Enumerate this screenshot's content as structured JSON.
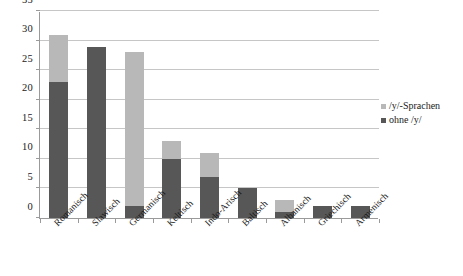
{
  "chart_data": {
    "type": "bar",
    "title": "",
    "subtitle": "",
    "xlabel": "",
    "ylabel": "",
    "ylim": [
      0,
      35
    ],
    "ytick_step": 5,
    "ytick_labels": [
      "0",
      "5",
      "10",
      "15",
      "20",
      "25",
      "30",
      "35"
    ],
    "grid": true,
    "stacked": true,
    "legend_position": "right-middle-outside",
    "categories": [
      "Romanisch",
      "Slawisch",
      "Germanisch",
      "Keltisch",
      "Indo-Arisch",
      "Baltisch",
      "Albanisch",
      "Griechisch",
      "Armenisch"
    ],
    "series": [
      {
        "name": "ohne /y/",
        "color": "#575757",
        "values": [
          23,
          29,
          2,
          10,
          7,
          5,
          1,
          2,
          2
        ]
      },
      {
        "name": "/y/-Sprachen",
        "color": "#b8b8b8",
        "values": [
          8,
          0,
          26,
          3,
          4,
          0,
          2,
          0,
          0
        ]
      }
    ],
    "totals": [
      31,
      29,
      28,
      13,
      11,
      5,
      3,
      2,
      2
    ]
  },
  "legend": {
    "entries": [
      {
        "label": "/y/-Sprachen",
        "color": "#b8b8b8"
      },
      {
        "label": "ohne /y/",
        "color": "#575757"
      }
    ]
  },
  "axis": {
    "line_color": "#9a9a9a",
    "grid_color": "#c6c6c6"
  }
}
